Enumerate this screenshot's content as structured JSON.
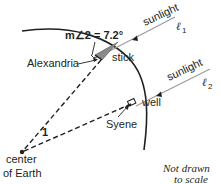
{
  "diagram": {
    "angle_label": "m∠2 = 7.2°",
    "stick_label": "stick",
    "alexandria_label": "Alexandria",
    "syene_label": "Syene",
    "well_label": "well",
    "angle1_label": "1",
    "center_label_line1": "center",
    "center_label_line2": "of Earth",
    "sunlight1_label": "sunlight",
    "line1_label": "ℓ",
    "line1_sub": "1",
    "sunlight2_label": "sunlight",
    "line2_label": "ℓ",
    "line2_sub": "2",
    "note_line1": "Not drawn",
    "note_line2": "to scale"
  },
  "colors": {
    "ink": "#231f20",
    "ray": "#9a9a9a",
    "stick_shadow": "#8a8a8a"
  }
}
